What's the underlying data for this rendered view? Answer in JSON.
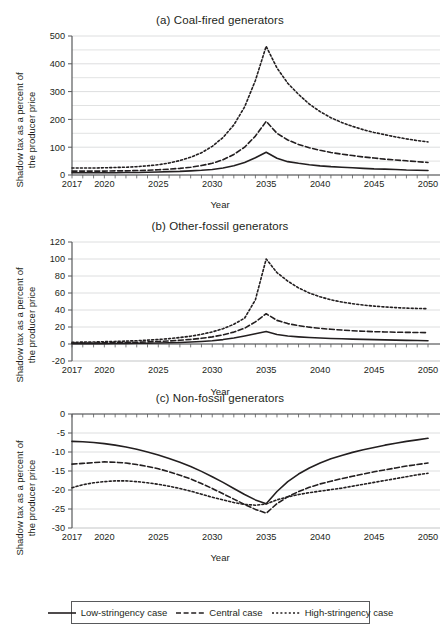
{
  "figure": {
    "axis_label_y": {
      "line1": "Shadow tax as a percent of",
      "line2": "the producer price"
    },
    "axis_label_x": "Year",
    "colors": {
      "line": "#231f20",
      "grid": "#d9dadb",
      "axis": "#58595b",
      "background": "#ffffff"
    }
  },
  "legend": {
    "items": [
      {
        "label": "Low-stringency case",
        "style": "solid"
      },
      {
        "label": "Central case",
        "style": "dashed"
      },
      {
        "label": "High-stringency case",
        "style": "dotted"
      }
    ]
  },
  "chart_data": [
    {
      "type": "line",
      "id": "panel-a",
      "title": "(a) Coal-fired generators",
      "xlabel": "Year",
      "ylabel": "Shadow tax as a percent of the producer price",
      "xlim": [
        2017,
        2050
      ],
      "ylim": [
        0,
        500
      ],
      "yticks": [
        0,
        100,
        200,
        300,
        400,
        500
      ],
      "yticks_minor": [
        50,
        150,
        250,
        350,
        450
      ],
      "xticks": [
        2017,
        2020,
        2025,
        2030,
        2035,
        2040,
        2045,
        2050
      ],
      "grid": true,
      "legend_position": "figure-bottom",
      "x": [
        2017,
        2018,
        2019,
        2020,
        2021,
        2022,
        2023,
        2024,
        2025,
        2026,
        2027,
        2028,
        2029,
        2030,
        2031,
        2032,
        2033,
        2034,
        2035,
        2036,
        2037,
        2038,
        2039,
        2040,
        2041,
        2042,
        2043,
        2044,
        2045,
        2046,
        2047,
        2048,
        2049,
        2050
      ],
      "series": [
        {
          "name": "Low-stringency case",
          "style": "solid",
          "values": [
            8,
            8,
            8,
            8,
            8,
            9,
            9,
            10,
            11,
            12,
            13,
            15,
            17,
            20,
            25,
            33,
            45,
            62,
            82,
            60,
            48,
            42,
            37,
            33,
            30,
            28,
            26,
            24,
            22,
            21,
            20,
            18,
            17,
            16
          ]
        },
        {
          "name": "Central case",
          "style": "dashed",
          "values": [
            14,
            14,
            14,
            14,
            15,
            15,
            16,
            17,
            19,
            21,
            24,
            28,
            34,
            42,
            55,
            74,
            100,
            140,
            193,
            150,
            126,
            110,
            98,
            89,
            81,
            75,
            70,
            65,
            61,
            57,
            54,
            51,
            48,
            45
          ]
        },
        {
          "name": "High-stringency case",
          "style": "dotted",
          "values": [
            25,
            25,
            25,
            26,
            27,
            28,
            30,
            33,
            37,
            43,
            52,
            64,
            80,
            103,
            135,
            180,
            245,
            340,
            463,
            385,
            330,
            290,
            255,
            228,
            206,
            189,
            175,
            163,
            153,
            145,
            137,
            130,
            124,
            119
          ]
        }
      ]
    },
    {
      "type": "line",
      "id": "panel-b",
      "title": "(b) Other-fossil generators",
      "xlabel": "Year",
      "ylabel": "Shadow tax as a percent of the producer price",
      "xlim": [
        2017,
        2050
      ],
      "ylim": [
        -20,
        120
      ],
      "yticks": [
        -20,
        0,
        20,
        40,
        60,
        80,
        100,
        120
      ],
      "xticks": [
        2017,
        2020,
        2025,
        2030,
        2035,
        2040,
        2045,
        2050
      ],
      "grid": true,
      "x": [
        2017,
        2018,
        2019,
        2020,
        2021,
        2022,
        2023,
        2024,
        2025,
        2026,
        2027,
        2028,
        2029,
        2030,
        2031,
        2032,
        2033,
        2034,
        2035,
        2036,
        2037,
        2038,
        2039,
        2040,
        2041,
        2042,
        2043,
        2044,
        2045,
        2046,
        2047,
        2048,
        2049,
        2050
      ],
      "series": [
        {
          "name": "Low-stringency case",
          "style": "solid",
          "values": [
            0.4,
            0.4,
            0.5,
            0.5,
            0.6,
            0.7,
            0.8,
            0.9,
            1.1,
            1.4,
            1.8,
            2.3,
            3.0,
            3.9,
            5.2,
            7.0,
            9.4,
            12.0,
            14.6,
            11.2,
            9.4,
            8.4,
            7.6,
            7.0,
            6.5,
            6.1,
            5.7,
            5.4,
            5.1,
            4.8,
            4.5,
            4.3,
            4.1,
            3.9
          ]
        },
        {
          "name": "Central case",
          "style": "dashed",
          "values": [
            1.0,
            1.1,
            1.2,
            1.4,
            1.6,
            1.8,
            2.1,
            2.5,
            3.0,
            3.6,
            4.4,
            5.4,
            6.7,
            8.4,
            10.8,
            14.0,
            18.6,
            26.0,
            35.6,
            27.8,
            24.0,
            21.6,
            19.8,
            18.4,
            17.3,
            16.4,
            15.6,
            15.0,
            14.5,
            14.2,
            13.9,
            13.7,
            13.5,
            13.4
          ]
        },
        {
          "name": "High-stringency case",
          "style": "dotted",
          "values": [
            2.0,
            2.2,
            2.4,
            2.7,
            3.0,
            3.4,
            3.9,
            4.5,
            5.3,
            6.3,
            7.6,
            9.2,
            11.4,
            14.2,
            18.0,
            23.2,
            30.4,
            52.0,
            100.0,
            84.0,
            74.0,
            66.0,
            60.0,
            55.5,
            52.0,
            49.4,
            47.4,
            45.8,
            44.6,
            43.6,
            42.8,
            42.2,
            41.8,
            41.5
          ]
        }
      ]
    },
    {
      "type": "line",
      "id": "panel-c",
      "title": "(c) Non-fossil generators",
      "xlabel": "Year",
      "ylabel": "Shadow tax as a percent of the producer price",
      "xlim": [
        2017,
        2050
      ],
      "ylim": [
        -30,
        0
      ],
      "yticks": [
        0,
        -5,
        -10,
        -15,
        -20,
        -25,
        -30
      ],
      "xticks": [
        2017,
        2020,
        2025,
        2030,
        2035,
        2040,
        2045,
        2050
      ],
      "grid": true,
      "x": [
        2017,
        2018,
        2019,
        2020,
        2021,
        2022,
        2023,
        2024,
        2025,
        2026,
        2027,
        2028,
        2029,
        2030,
        2031,
        2032,
        2033,
        2034,
        2035,
        2036,
        2037,
        2038,
        2039,
        2040,
        2041,
        2042,
        2043,
        2044,
        2045,
        2046,
        2047,
        2048,
        2049,
        2050
      ],
      "series": [
        {
          "name": "Low-stringency case",
          "style": "solid",
          "values": [
            -7.2,
            -7.3,
            -7.5,
            -7.8,
            -8.2,
            -8.7,
            -9.3,
            -10.0,
            -10.8,
            -11.7,
            -12.7,
            -13.8,
            -15.1,
            -16.5,
            -18.0,
            -19.6,
            -21.2,
            -22.6,
            -23.6,
            -20.4,
            -17.8,
            -15.8,
            -14.2,
            -12.9,
            -11.8,
            -10.9,
            -10.1,
            -9.4,
            -8.8,
            -8.2,
            -7.7,
            -7.2,
            -6.8,
            -6.4
          ]
        },
        {
          "name": "Central case",
          "style": "dashed",
          "values": [
            -13.2,
            -13.0,
            -12.8,
            -12.6,
            -12.7,
            -12.9,
            -13.3,
            -13.8,
            -14.4,
            -15.2,
            -16.1,
            -17.1,
            -18.3,
            -19.6,
            -21.0,
            -22.4,
            -23.8,
            -25.1,
            -26.1,
            -23.6,
            -21.8,
            -20.4,
            -19.3,
            -18.4,
            -17.7,
            -17.0,
            -16.4,
            -15.8,
            -15.2,
            -14.7,
            -14.2,
            -13.7,
            -13.3,
            -12.9
          ]
        },
        {
          "name": "High-stringency case",
          "style": "dotted",
          "values": [
            -19.4,
            -18.6,
            -18.1,
            -17.8,
            -17.6,
            -17.6,
            -17.8,
            -18.1,
            -18.5,
            -19.0,
            -19.6,
            -20.3,
            -21.1,
            -21.9,
            -22.6,
            -23.3,
            -23.8,
            -24.0,
            -23.7,
            -22.6,
            -21.8,
            -21.2,
            -20.7,
            -20.3,
            -19.9,
            -19.5,
            -19.0,
            -18.5,
            -18.0,
            -17.5,
            -17.0,
            -16.5,
            -16.0,
            -15.6
          ]
        }
      ]
    }
  ]
}
